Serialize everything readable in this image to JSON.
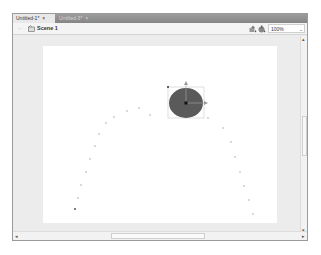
{
  "tabs": [
    {
      "label": "Untitled-1*",
      "close": "×",
      "active": true
    },
    {
      "label": "Untitled-3*",
      "close": "×",
      "active": false
    }
  ],
  "toolbar": {
    "back_icon": "←",
    "scene_label": "Scene 1",
    "zoom_value": "100%",
    "zoom_chevron": "⌄"
  },
  "scrollbars": {
    "up": "▴",
    "down": "▾",
    "left": "◂",
    "right": "▸"
  },
  "stage": {
    "background": "#ffffff",
    "ellipse": {
      "cx": 143,
      "cy": 57,
      "rx": 17,
      "ry": 15,
      "fill": "#5a5a5a"
    },
    "motion_path_points": [
      [
        32,
        163
      ],
      [
        35,
        152
      ],
      [
        38,
        139
      ],
      [
        43,
        126
      ],
      [
        47,
        113
      ],
      [
        52,
        100
      ],
      [
        56,
        88
      ],
      [
        63,
        77
      ],
      [
        71,
        71
      ],
      [
        84,
        65
      ],
      [
        96,
        62
      ],
      [
        107,
        69
      ],
      [
        165,
        72
      ],
      [
        180,
        82
      ],
      [
        188,
        96
      ],
      [
        192,
        111
      ],
      [
        197,
        126
      ],
      [
        201,
        140
      ],
      [
        206,
        154
      ],
      [
        210,
        168
      ],
      [
        214,
        180
      ],
      [
        219,
        192
      ]
    ]
  }
}
